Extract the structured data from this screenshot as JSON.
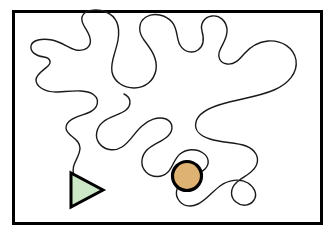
{
  "figure": {
    "title": "Winding curve path between a triangle and a circle inside a rectangular frame",
    "canvas": {
      "width": 336,
      "height": 236,
      "background_color": "#ffffff"
    },
    "frame": {
      "name": "rectangular-border",
      "x": 13.5,
      "y": 11.5,
      "width": 308,
      "height": 212,
      "stroke_color": "#000000",
      "stroke_width": 3,
      "fill_color": "#ffffff"
    },
    "curve": {
      "name": "winding-path",
      "stroke_color": "#1a1a1a",
      "stroke_width": 1.4,
      "fill": "none",
      "description": "A single long meandering closed-ish loop with several rounded lobes filling the frame; the left end terminates at the top-left vertex of the green triangle and the right end terminates at the lower-right of the tan circle.",
      "path": "M 74 176 C 70 164 80 158 80 148 C 80 138 66 136 66 128 C 66 118 82 116 90 112 C 98 108 100 100 94 95 C 86 88 66 92 56 92 C 44 92 36 86 36 80 C 36 74 44 70 48 66 C 52 62 50 58 44 57 C 36 56 30 52 31 46 C 32 40 42 38 52 40 C 62 42 68 48 76 50 C 86 52 92 46 90 38 C 88 29 80 24 82 17 C 84 10 96 8 106 12 C 118 17 120 28 118 40 C 116 52 110 62 112 72 C 114 82 124 88 134 88 C 146 88 154 80 156 70 C 158 58 150 48 144 40 C 138 32 138 22 146 17 C 154 12 166 15 172 22 C 178 29 176 38 180 45 C 184 52 192 54 198 50 C 204 46 204 38 202 31 C 200 24 204 17 212 16 C 220 15 226 21 227 29 C 228 37 223 43 220 50 C 217 57 220 63 227 64 C 234 65 239 60 244 54 C 250 47 258 42 268 41 C 282 40 294 48 296 60 C 298 73 288 84 274 90 C 258 97 238 99 222 104 C 208 108 198 114 196 122 C 194 130 200 136 210 139 C 222 143 236 142 246 146 C 256 150 260 158 256 166 C 252 174 242 177 236 183 C 230 189 230 197 236 202 C 242 207 250 206 254 200 C 258 194 254 187 248 183 C 240 178 228 180 220 186 C 212 192 206 200 198 204 C 190 208 182 206 178 199 C 174 192 178 184 184 180 C 191 175 200 174 205 169 C 210 164 209 157 203 153 C 196 148 186 149 180 154 C 174 159 173 167 168 172 C 162 178 152 178 146 172 C 140 166 141 157 146 151 C 152 144 162 142 168 136 C 174 130 173 122 166 119 C 158 116 148 120 142 126 C 134 133 130 142 122 147 C 114 152 104 150 99 143 C 94 136 97 127 103 122 C 110 116 120 115 126 110 C 132 105 131 97 124 94"
    },
    "shapes": [
      {
        "name": "triangle-marker",
        "kind": "triangle",
        "orientation": "pointing-right",
        "points": "71,173 71,207 103,190",
        "fill_color": "#cce8c6",
        "stroke_color": "#000000",
        "stroke_width": 3
      },
      {
        "name": "circle-marker",
        "kind": "circle",
        "cx": 187,
        "cy": 176,
        "r": 14.5,
        "fill_color": "#ddb273",
        "stroke_color": "#000000",
        "stroke_width": 3.2
      }
    ]
  }
}
